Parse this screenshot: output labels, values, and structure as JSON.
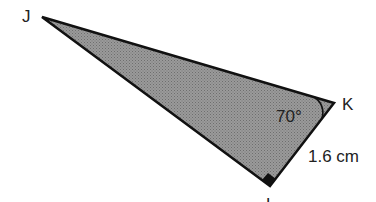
{
  "figure": {
    "type": "right triangle",
    "vertices": {
      "J": {
        "label": "J"
      },
      "K": {
        "label": "K"
      },
      "L": {
        "label": "L"
      }
    },
    "angle_K": "70°",
    "side_KL": "1.6 cm",
    "right_angle_at": "L",
    "fill_color": "#8a8a8a",
    "stroke_color": "#111111"
  }
}
